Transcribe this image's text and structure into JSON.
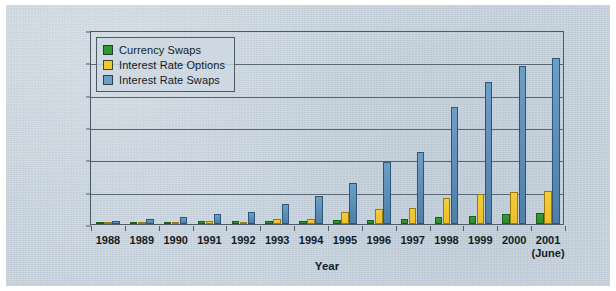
{
  "chart_data": {
    "type": "bar",
    "title": "",
    "xlabel": "Year",
    "ylabel": "U.S. Dollars in Billions",
    "ylim": [
      0,
      60000
    ],
    "ytick_labels": [
      "60,000",
      "50,000",
      "40,000",
      "30,000",
      "20,000",
      "10,000",
      "0"
    ],
    "ytick_values": [
      60000,
      50000,
      40000,
      30000,
      20000,
      10000,
      0
    ],
    "grid": true,
    "legend_position": "upper-left-inside",
    "categories": [
      "1988",
      "1989",
      "1990",
      "1991",
      "1992",
      "1993",
      "1994",
      "1995",
      "1996",
      "1997",
      "1998",
      "1999",
      "2000",
      "2001"
    ],
    "category_sublabels": [
      "",
      "",
      "",
      "",
      "",
      "",
      "",
      "",
      "",
      "",
      "",
      "",
      "",
      "(June)"
    ],
    "series": [
      {
        "name": "Currency Swaps",
        "color": "#2f9a2b",
        "values": [
          320,
          430,
          580,
          810,
          860,
          900,
          915,
          1200,
          1300,
          1580,
          2250,
          2450,
          3200,
          3400
        ]
      },
      {
        "name": "Interest Rate Options",
        "color": "#f2c62f",
        "values": [
          330,
          450,
          560,
          1070,
          600,
          1400,
          1570,
          3700,
          4720,
          4920,
          7997,
          9380,
          9950,
          10200
        ]
      },
      {
        "name": "Interest Rate Swaps",
        "color": "#6d9ec4",
        "values": [
          1010,
          1500,
          2310,
          3065,
          3850,
          6177,
          8816,
          12811,
          19171,
          22291,
          36262,
          43936,
          48768,
          51407
        ]
      }
    ]
  }
}
